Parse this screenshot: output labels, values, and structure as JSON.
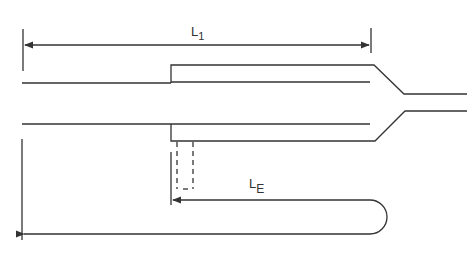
{
  "diagram": {
    "labels": {
      "l1_main": "L",
      "l1_sub": "1",
      "le_main": "L",
      "le_sub": "E"
    },
    "colors": {
      "stroke": "#333333",
      "background": "#ffffff"
    }
  }
}
